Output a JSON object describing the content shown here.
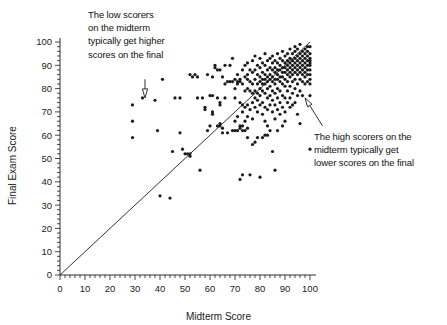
{
  "chart_data": {
    "type": "scatter",
    "title": "",
    "xlabel": "Midterm Score",
    "ylabel": "Final Exam Score",
    "xlim": [
      0,
      100
    ],
    "ylim": [
      0,
      100
    ],
    "xticks": [
      0,
      10,
      20,
      30,
      40,
      50,
      60,
      70,
      80,
      90,
      100
    ],
    "yticks": [
      0,
      10,
      20,
      30,
      40,
      50,
      60,
      70,
      80,
      90,
      100
    ],
    "xtick_labels": [
      "0",
      "10",
      "20",
      "30",
      "40",
      "50",
      "60",
      "70",
      "80",
      "90",
      "100"
    ],
    "ytick_labels": [
      "0",
      "10",
      "20",
      "30",
      "40",
      "50",
      "60",
      "70",
      "80",
      "90",
      "100"
    ],
    "minor_tick_step": 2,
    "grid": false,
    "legend": null,
    "marker_color": "#1a1a1a",
    "marker_size": 1.6,
    "reference_line": {
      "name": "identity-line",
      "type": "line",
      "equation": "y = x",
      "x": [
        0,
        100
      ],
      "y": [
        0,
        100
      ],
      "color": "#1a1a1a",
      "width": 0.9
    },
    "annotations": [
      {
        "id": "low-scorers",
        "text": "The low scorers\non the midterm\ntypically get higher\nscores on the final",
        "arrow_from": [
          34,
          84
        ],
        "arrow_to": [
          34,
          76
        ]
      },
      {
        "id": "high-scorers",
        "text": "The high scorers on the\nmidterm typically get\nlower scores on the final",
        "arrow_from": [
          105,
          64
        ],
        "arrow_to": [
          98,
          76
        ]
      }
    ],
    "points": [
      [
        29,
        73
      ],
      [
        29,
        66
      ],
      [
        29,
        59
      ],
      [
        33,
        76
      ],
      [
        38,
        75
      ],
      [
        39,
        62
      ],
      [
        40,
        34
      ],
      [
        41,
        84
      ],
      [
        44,
        33
      ],
      [
        45,
        53
      ],
      [
        46,
        76
      ],
      [
        48,
        76
      ],
      [
        48,
        61
      ],
      [
        49,
        54
      ],
      [
        50,
        52
      ],
      [
        51,
        52
      ],
      [
        52,
        52
      ],
      [
        52,
        51
      ],
      [
        53,
        85
      ],
      [
        54,
        86
      ],
      [
        55,
        85
      ],
      [
        55,
        76
      ],
      [
        56,
        45
      ],
      [
        57,
        76
      ],
      [
        58,
        72
      ],
      [
        58,
        71
      ],
      [
        59,
        62
      ],
      [
        59,
        86
      ],
      [
        60,
        77
      ],
      [
        60,
        64
      ],
      [
        61,
        85
      ],
      [
        61,
        77
      ],
      [
        61,
        70
      ],
      [
        61,
        69
      ],
      [
        62,
        90
      ],
      [
        62,
        89
      ],
      [
        63,
        76
      ],
      [
        63,
        64
      ],
      [
        64,
        74
      ],
      [
        64,
        73
      ],
      [
        64,
        65
      ],
      [
        64,
        64
      ],
      [
        65,
        85
      ],
      [
        65,
        63
      ],
      [
        65,
        61
      ],
      [
        66,
        82
      ],
      [
        66,
        76
      ],
      [
        67,
        83
      ],
      [
        67,
        61
      ],
      [
        68,
        90
      ],
      [
        68,
        83
      ],
      [
        69,
        93
      ],
      [
        69,
        83
      ],
      [
        69,
        62
      ],
      [
        70,
        84
      ],
      [
        70,
        80
      ],
      [
        70,
        76
      ],
      [
        70,
        66
      ],
      [
        71,
        86
      ],
      [
        71,
        83
      ],
      [
        71,
        82
      ],
      [
        71,
        68
      ],
      [
        71,
        62
      ],
      [
        72,
        84
      ],
      [
        72,
        83
      ],
      [
        72,
        74
      ],
      [
        72,
        64
      ],
      [
        72,
        63
      ],
      [
        72,
        41
      ],
      [
        73,
        88
      ],
      [
        73,
        82
      ],
      [
        73,
        73
      ],
      [
        73,
        70
      ],
      [
        73,
        64
      ],
      [
        73,
        43
      ],
      [
        74,
        90
      ],
      [
        74,
        85
      ],
      [
        74,
        79
      ],
      [
        74,
        72
      ],
      [
        74,
        66
      ],
      [
        75,
        91
      ],
      [
        75,
        86
      ],
      [
        75,
        84
      ],
      [
        75,
        80
      ],
      [
        75,
        73
      ],
      [
        75,
        68
      ],
      [
        75,
        63
      ],
      [
        76,
        88
      ],
      [
        76,
        83
      ],
      [
        76,
        79
      ],
      [
        76,
        71
      ],
      [
        76,
        43
      ],
      [
        77,
        92
      ],
      [
        77,
        87
      ],
      [
        77,
        82
      ],
      [
        77,
        78
      ],
      [
        77,
        74
      ],
      [
        77,
        67
      ],
      [
        78,
        94
      ],
      [
        78,
        88
      ],
      [
        78,
        84
      ],
      [
        78,
        79
      ],
      [
        78,
        76
      ],
      [
        78,
        72
      ],
      [
        78,
        57
      ],
      [
        79,
        90
      ],
      [
        79,
        86
      ],
      [
        79,
        82
      ],
      [
        79,
        78
      ],
      [
        79,
        75
      ],
      [
        79,
        70
      ],
      [
        80,
        93
      ],
      [
        80,
        89
      ],
      [
        80,
        85
      ],
      [
        80,
        83
      ],
      [
        80,
        80
      ],
      [
        80,
        77
      ],
      [
        80,
        73
      ],
      [
        80,
        42
      ],
      [
        81,
        91
      ],
      [
        81,
        87
      ],
      [
        81,
        84
      ],
      [
        81,
        82
      ],
      [
        81,
        79
      ],
      [
        81,
        74
      ],
      [
        81,
        69
      ],
      [
        82,
        95
      ],
      [
        82,
        90
      ],
      [
        82,
        86
      ],
      [
        82,
        84
      ],
      [
        82,
        82
      ],
      [
        82,
        78
      ],
      [
        82,
        72
      ],
      [
        82,
        66
      ],
      [
        82,
        60
      ],
      [
        83,
        92
      ],
      [
        83,
        88
      ],
      [
        83,
        85
      ],
      [
        83,
        83
      ],
      [
        83,
        80
      ],
      [
        83,
        76
      ],
      [
        83,
        71
      ],
      [
        83,
        64
      ],
      [
        84,
        93
      ],
      [
        84,
        89
      ],
      [
        84,
        86
      ],
      [
        84,
        84
      ],
      [
        84,
        81
      ],
      [
        84,
        77
      ],
      [
        84,
        73
      ],
      [
        84,
        62
      ],
      [
        85,
        94
      ],
      [
        85,
        91
      ],
      [
        85,
        88
      ],
      [
        85,
        85
      ],
      [
        85,
        83
      ],
      [
        85,
        79
      ],
      [
        85,
        75
      ],
      [
        85,
        70
      ],
      [
        85,
        53
      ],
      [
        86,
        92
      ],
      [
        86,
        89
      ],
      [
        86,
        87
      ],
      [
        86,
        84
      ],
      [
        86,
        82
      ],
      [
        86,
        78
      ],
      [
        86,
        73
      ],
      [
        86,
        67
      ],
      [
        86,
        45
      ],
      [
        87,
        95
      ],
      [
        87,
        91
      ],
      [
        87,
        88
      ],
      [
        87,
        86
      ],
      [
        87,
        84
      ],
      [
        87,
        80
      ],
      [
        87,
        76
      ],
      [
        87,
        71
      ],
      [
        88,
        93
      ],
      [
        88,
        90
      ],
      [
        88,
        88
      ],
      [
        88,
        85
      ],
      [
        88,
        83
      ],
      [
        88,
        79
      ],
      [
        88,
        74
      ],
      [
        88,
        69
      ],
      [
        89,
        96
      ],
      [
        89,
        92
      ],
      [
        89,
        89
      ],
      [
        89,
        87
      ],
      [
        89,
        85
      ],
      [
        89,
        82
      ],
      [
        89,
        77
      ],
      [
        89,
        72
      ],
      [
        90,
        94
      ],
      [
        90,
        91
      ],
      [
        90,
        89
      ],
      [
        90,
        87
      ],
      [
        90,
        84
      ],
      [
        90,
        81
      ],
      [
        90,
        76
      ],
      [
        90,
        70
      ],
      [
        90,
        66
      ],
      [
        91,
        95
      ],
      [
        91,
        92
      ],
      [
        91,
        90
      ],
      [
        91,
        88
      ],
      [
        91,
        86
      ],
      [
        91,
        83
      ],
      [
        91,
        79
      ],
      [
        91,
        74
      ],
      [
        92,
        97
      ],
      [
        92,
        93
      ],
      [
        92,
        91
      ],
      [
        92,
        89
      ],
      [
        92,
        87
      ],
      [
        92,
        85
      ],
      [
        92,
        81
      ],
      [
        92,
        76
      ],
      [
        92,
        72
      ],
      [
        93,
        95
      ],
      [
        93,
        92
      ],
      [
        93,
        90
      ],
      [
        93,
        88
      ],
      [
        93,
        86
      ],
      [
        93,
        83
      ],
      [
        93,
        78
      ],
      [
        93,
        73
      ],
      [
        94,
        98
      ],
      [
        94,
        96
      ],
      [
        94,
        93
      ],
      [
        94,
        91
      ],
      [
        94,
        89
      ],
      [
        94,
        87
      ],
      [
        94,
        84
      ],
      [
        94,
        80
      ],
      [
        94,
        74
      ],
      [
        95,
        97
      ],
      [
        95,
        94
      ],
      [
        95,
        92
      ],
      [
        95,
        90
      ],
      [
        95,
        88
      ],
      [
        95,
        86
      ],
      [
        95,
        82
      ],
      [
        95,
        77
      ],
      [
        95,
        69
      ],
      [
        96,
        99
      ],
      [
        96,
        95
      ],
      [
        96,
        93
      ],
      [
        96,
        91
      ],
      [
        96,
        89
      ],
      [
        96,
        87
      ],
      [
        96,
        84
      ],
      [
        96,
        79
      ],
      [
        96,
        65
      ],
      [
        97,
        96
      ],
      [
        97,
        94
      ],
      [
        97,
        92
      ],
      [
        97,
        90
      ],
      [
        97,
        88
      ],
      [
        97,
        86
      ],
      [
        97,
        83
      ],
      [
        97,
        77
      ],
      [
        98,
        97
      ],
      [
        98,
        95
      ],
      [
        98,
        93
      ],
      [
        98,
        91
      ],
      [
        98,
        89
      ],
      [
        98,
        87
      ],
      [
        98,
        85
      ],
      [
        98,
        82
      ],
      [
        99,
        98
      ],
      [
        99,
        96
      ],
      [
        99,
        94
      ],
      [
        99,
        92
      ],
      [
        99,
        90
      ],
      [
        99,
        88
      ],
      [
        99,
        86
      ],
      [
        99,
        83
      ],
      [
        100,
        98
      ],
      [
        100,
        95
      ],
      [
        100,
        93
      ],
      [
        100,
        92
      ],
      [
        100,
        91
      ],
      [
        100,
        90
      ],
      [
        100,
        88
      ],
      [
        100,
        86
      ],
      [
        100,
        84
      ],
      [
        100,
        82
      ],
      [
        100,
        54
      ],
      [
        64,
        88
      ],
      [
        63,
        88
      ],
      [
        66,
        90
      ],
      [
        52,
        86
      ],
      [
        79,
        59
      ],
      [
        81,
        59
      ],
      [
        83,
        60
      ],
      [
        74,
        62
      ],
      [
        73,
        62
      ],
      [
        70,
        62
      ],
      [
        89,
        64
      ],
      [
        87,
        62
      ],
      [
        75,
        59
      ],
      [
        77,
        56
      ],
      [
        100,
        77
      ]
    ]
  },
  "annotations_display": {
    "low_scorers": "The low scorers\non the midterm\ntypically get higher\nscores on the final",
    "high_scorers": "The high scorers on the\nmidterm typically get\nlower scores on the final"
  },
  "colors": {
    "background": "#ffffff",
    "ink": "#1a1a1a",
    "axis": "#1a1a1a"
  }
}
